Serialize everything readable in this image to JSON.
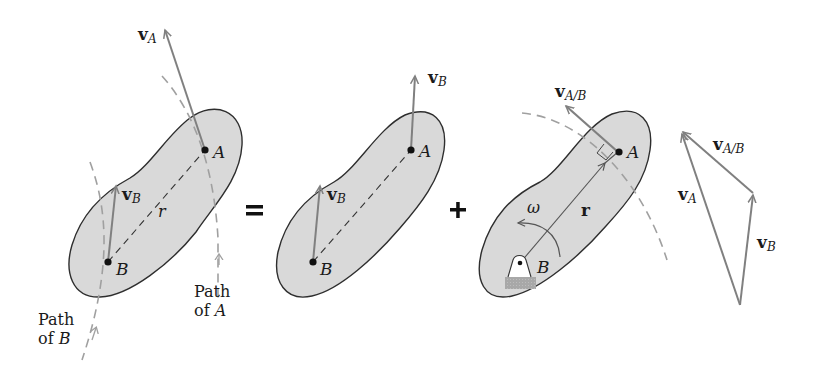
{
  "figure": {
    "colors": {
      "body_fill": "#d9d9d9",
      "body_stroke": "#333333",
      "vector": "#808080",
      "dashed_path": "#a0a0a0",
      "text": "#1a1a1a"
    }
  },
  "panel1": {
    "vA": {
      "main": "v",
      "sub": "A"
    },
    "vB": {
      "main": "v",
      "sub": "B"
    },
    "point_A": "A",
    "point_B": "B",
    "r": "r",
    "pathA_line1": "Path",
    "pathA_line2_of": "of",
    "pathA_line2_pt": "A",
    "pathB_line1": "Path",
    "pathB_line2_of": "of",
    "pathB_line2_pt": "B"
  },
  "operators": {
    "equals": "=",
    "plus": "+"
  },
  "panel2": {
    "vB_top": {
      "main": "v",
      "sub": "B"
    },
    "vB": {
      "main": "v",
      "sub": "B"
    },
    "point_A": "A",
    "point_B": "B"
  },
  "panel3": {
    "vAB": {
      "main": "v",
      "sub": "A/B"
    },
    "omega": "ω",
    "r": "r",
    "point_A": "A",
    "point_B": "B"
  },
  "triangle": {
    "vA": {
      "main": "v",
      "sub": "A"
    },
    "vAB": {
      "main": "v",
      "sub": "A/B"
    },
    "vB": {
      "main": "v",
      "sub": "B"
    }
  }
}
